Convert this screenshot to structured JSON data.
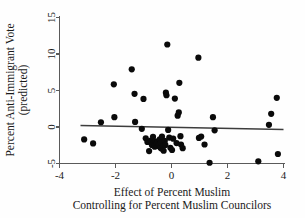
{
  "chart_data": {
    "type": "scatter",
    "title": "",
    "xlabel": "Effect of Percent Muslim Controlling for Percent Muslim Councilors",
    "xlabel_line1": "Effect of Percent Muslim",
    "xlabel_line2": "Controlling for Percent Muslim Councilors",
    "ylabel": "Percent Anti-Immigrant Vote (predicted)",
    "ylabel_line1": "Percent Anti-Immigrant Vote",
    "ylabel_line2": "(predicted)",
    "xlim": [
      -4,
      4
    ],
    "ylim": [
      -5,
      15
    ],
    "xticks": [
      -4,
      -2,
      0,
      2,
      4
    ],
    "xtick_labels": [
      "-4",
      "-2",
      "0",
      "2",
      "4"
    ],
    "yticks": [
      -5,
      0,
      5,
      10,
      15
    ],
    "ytick_labels": [
      "-5",
      "0",
      "5",
      "10",
      "15"
    ],
    "grid": false,
    "legend": false,
    "marker_color": "#0a0a0a",
    "marker_size": 3.1,
    "fit_line": {
      "name": "linear fit",
      "color": "#3d3d3d",
      "x_start": -3.25,
      "y_start": 0.22,
      "x_end": 4.0,
      "y_end": -0.35
    },
    "points": [
      [
        -3.12,
        -1.7
      ],
      [
        -2.8,
        -2.25
      ],
      [
        -2.52,
        0.65
      ],
      [
        -2.06,
        5.85
      ],
      [
        -2.04,
        1.35
      ],
      [
        -1.42,
        7.9
      ],
      [
        -1.32,
        4.55
      ],
      [
        -1.3,
        0.7
      ],
      [
        -1.06,
        -0.25
      ],
      [
        -1.0,
        3.85
      ],
      [
        -0.92,
        -1.55
      ],
      [
        -0.86,
        -2.05
      ],
      [
        -0.8,
        -3.3
      ],
      [
        -0.74,
        -1.85
      ],
      [
        -0.7,
        -2.45
      ],
      [
        -0.66,
        -1.35
      ],
      [
        -0.62,
        -2.15
      ],
      [
        -0.6,
        -2.7
      ],
      [
        -0.58,
        -1.95
      ],
      [
        -0.56,
        -2.35
      ],
      [
        -0.54,
        -2.55
      ],
      [
        -0.52,
        -2.2
      ],
      [
        -0.5,
        -2.05
      ],
      [
        -0.48,
        -2.6
      ],
      [
        -0.46,
        -2.3
      ],
      [
        -0.44,
        -2.45
      ],
      [
        -0.42,
        -1.7
      ],
      [
        -0.4,
        -2.8
      ],
      [
        -0.38,
        -2.15
      ],
      [
        -0.36,
        -2.95
      ],
      [
        -0.34,
        -1.3
      ],
      [
        -0.3,
        -2.65
      ],
      [
        -0.28,
        -3.25
      ],
      [
        -0.24,
        -1.9
      ],
      [
        -0.22,
        -2.45
      ],
      [
        -0.2,
        4.7
      ],
      [
        -0.18,
        4.35
      ],
      [
        -0.15,
        11.3
      ],
      [
        -0.12,
        -0.4
      ],
      [
        -0.08,
        -1.45
      ],
      [
        -0.04,
        -2.85
      ],
      [
        0.02,
        -3.15
      ],
      [
        0.06,
        -1.6
      ],
      [
        0.12,
        3.9
      ],
      [
        0.18,
        -2.2
      ],
      [
        0.22,
        1.55
      ],
      [
        0.26,
        2.0
      ],
      [
        0.28,
        6.05
      ],
      [
        0.32,
        -1.25
      ],
      [
        0.34,
        -2.4
      ],
      [
        0.4,
        -2.9
      ],
      [
        0.96,
        9.5
      ],
      [
        0.98,
        -1.5
      ],
      [
        1.06,
        -1.3
      ],
      [
        1.18,
        -2.4
      ],
      [
        1.36,
        -4.9
      ],
      [
        1.48,
        1.35
      ],
      [
        1.54,
        -0.45
      ],
      [
        3.1,
        -4.7
      ],
      [
        3.48,
        0.3
      ],
      [
        3.56,
        1.8
      ],
      [
        3.76,
        4.0
      ],
      [
        3.8,
        -3.7
      ]
    ]
  }
}
